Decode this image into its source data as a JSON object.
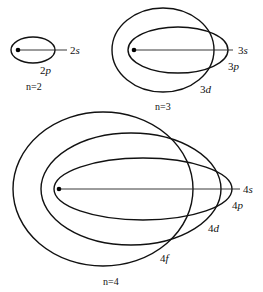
{
  "diagram": {
    "type": "bohr-sommerfeld-elliptical-orbits",
    "groups": [
      {
        "id": "n2",
        "label": "n=2",
        "orbits": [
          {
            "num": "2",
            "letter": "s",
            "kind": "line"
          },
          {
            "num": "2",
            "letter": "p",
            "kind": "ellipse"
          }
        ]
      },
      {
        "id": "n3",
        "label": "n=3",
        "orbits": [
          {
            "num": "3",
            "letter": "s",
            "kind": "line"
          },
          {
            "num": "3",
            "letter": "p",
            "kind": "ellipse"
          },
          {
            "num": "3",
            "letter": "d",
            "kind": "ellipse"
          }
        ]
      },
      {
        "id": "n4",
        "label": "n=4",
        "orbits": [
          {
            "num": "4",
            "letter": "s",
            "kind": "line"
          },
          {
            "num": "4",
            "letter": "p",
            "kind": "ellipse"
          },
          {
            "num": "4",
            "letter": "d",
            "kind": "ellipse"
          },
          {
            "num": "4",
            "letter": "f",
            "kind": "ellipse"
          }
        ]
      }
    ],
    "colors": {
      "stroke": "#111111",
      "background": "#ffffff"
    }
  }
}
